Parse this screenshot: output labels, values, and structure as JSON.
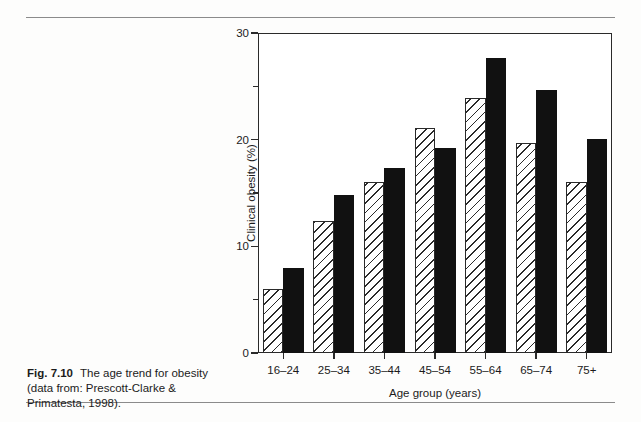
{
  "caption": {
    "fig_label": "Fig. 7.10",
    "text": "The age trend for obesity (data from: Prescott-Clarke & Primatesta, 1998)."
  },
  "chart_data": {
    "type": "bar",
    "title": "",
    "xlabel": "Age group (years)",
    "ylabel": "Clinical obesity (%)",
    "categories": [
      "16–24",
      "25–34",
      "35–44",
      "45–54",
      "55–64",
      "65–74",
      "75+"
    ],
    "series": [
      {
        "name": "Men",
        "style": "hatched",
        "values": [
          6.0,
          12.4,
          16.0,
          21.1,
          23.9,
          19.7,
          16.0
        ]
      },
      {
        "name": "Women",
        "style": "solid",
        "values": [
          8.0,
          14.8,
          17.3,
          19.2,
          27.7,
          24.7,
          20.1
        ]
      }
    ],
    "ylim": [
      0,
      30
    ],
    "ytick_labels": [
      "0",
      "10",
      "20",
      "30"
    ],
    "ytick_values": [
      0,
      10,
      20,
      30
    ],
    "yminor_values": [
      5,
      15,
      25
    ],
    "grid": false,
    "legend": "none",
    "colors": {
      "hatched": "#ffffff",
      "solid": "#111111",
      "axis": "#2a2a2a"
    }
  }
}
